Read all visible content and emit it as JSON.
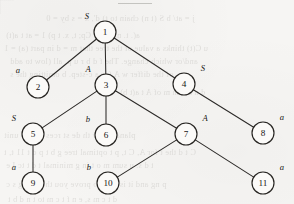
{
  "figure": {
    "width": 294,
    "height": 204,
    "background_color": "#f6f5f3",
    "node_fill_color": "#fbfaf8",
    "node_stroke_color": "#262421",
    "edge_color": "#2c2a28",
    "text_color": "#171513",
    "node_radius": 11
  },
  "nodes": [
    {
      "id": "1",
      "label": "1",
      "tag": "S",
      "cx": 105,
      "cy": 32,
      "tag_x": 87,
      "tag_y": 16,
      "tag_side": "upper-left"
    },
    {
      "id": "2",
      "label": "2",
      "tag": "a",
      "cx": 38,
      "cy": 87,
      "tag_x": 18,
      "tag_y": 70,
      "tag_side": "upper-left"
    },
    {
      "id": "3",
      "label": "3",
      "tag": "A",
      "cx": 106,
      "cy": 85,
      "tag_x": 88,
      "tag_y": 69,
      "tag_side": "upper-left"
    },
    {
      "id": "4",
      "label": "4",
      "tag": "S",
      "cx": 184,
      "cy": 84,
      "tag_x": 203,
      "tag_y": 68,
      "tag_side": "upper-right"
    },
    {
      "id": "5",
      "label": "5",
      "tag": "S",
      "cx": 33,
      "cy": 134,
      "tag_x": 14,
      "tag_y": 118,
      "tag_side": "upper-left"
    },
    {
      "id": "6",
      "label": "6",
      "tag": "b",
      "cx": 106,
      "cy": 135,
      "tag_x": 88,
      "tag_y": 119,
      "tag_side": "upper-left"
    },
    {
      "id": "7",
      "label": "7",
      "tag": "A",
      "cx": 186,
      "cy": 134,
      "tag_x": 205,
      "tag_y": 118,
      "tag_side": "upper-right"
    },
    {
      "id": "8",
      "label": "8",
      "tag": "a",
      "cx": 263,
      "cy": 133,
      "tag_x": 282,
      "tag_y": 117,
      "tag_side": "upper-right"
    },
    {
      "id": "9",
      "label": "9",
      "tag": "a",
      "cx": 33,
      "cy": 183,
      "tag_x": 14,
      "tag_y": 167,
      "tag_side": "upper-left"
    },
    {
      "id": "10",
      "label": "10",
      "tag": "b",
      "cx": 108,
      "cy": 183,
      "tag_x": 89,
      "tag_y": 167,
      "tag_side": "upper-left"
    },
    {
      "id": "11",
      "label": "11",
      "tag": "a",
      "cx": 263,
      "cy": 183,
      "tag_x": 282,
      "tag_y": 167,
      "tag_side": "upper-right"
    }
  ],
  "edges": [
    {
      "from": "1",
      "to": "2"
    },
    {
      "from": "1",
      "to": "3"
    },
    {
      "from": "1",
      "to": "4"
    },
    {
      "from": "3",
      "to": "5"
    },
    {
      "from": "3",
      "to": "6"
    },
    {
      "from": "3",
      "to": "7"
    },
    {
      "from": "4",
      "to": "8"
    },
    {
      "from": "5",
      "to": "9"
    },
    {
      "from": "7",
      "to": "10"
    },
    {
      "from": "7",
      "to": "11"
    }
  ],
  "bleed_text": [
    {
      "text": "j = at/ b S (t n) chain to t) d', x = s by = 0",
      "x": 46,
      "y": 14,
      "size": 8.4
    },
    {
      "text": "a(. t.  nfm orb  Cp; t, x. t p) 1 = at t a(t)",
      "x": 6,
      "y": 31,
      "size": 8.2
    },
    {
      "text": "u C(t) thinks a value of the tree that m = d in part (a) = 1",
      "x": 4,
      "y": 44,
      "size": 8.4
    },
    {
      "text": "and/or which change. The f d b r u p. all (low to add",
      "x": 10,
      "y": 57,
      "size": 8.4
    },
    {
      "text": "of the differ w A for a c-step. b omitting the s",
      "x": 10,
      "y": 70,
      "size": 8.4
    },
    {
      "text": "d n a r an m of A t a(t b)",
      "x": 120,
      "y": 88,
      "size": 8.2
    },
    {
      "text": "planation  w    th   de   st   rces  and   to  unit",
      "x": 4,
      "y": 130,
      "size": 8.6
    },
    {
      "text": "C t d the t for A, C t, p t optimal tree g b  t p d t 11 t, t",
      "x": 4,
      "y": 148,
      "size": 8.4
    },
    {
      "text": "t d s. u sum m  o t in g minimal  t d t  tc I e",
      "x": 6,
      "y": 161,
      "size": 8.4
    },
    {
      "text": "p   ng  and  it is able to prove you that not g s c",
      "x": 6,
      "y": 180,
      "size": 8.4
    },
    {
      "text": "d t c m s, e n f t  c m to t  n d b t",
      "x": 8,
      "y": 195,
      "size": 8.2
    }
  ]
}
